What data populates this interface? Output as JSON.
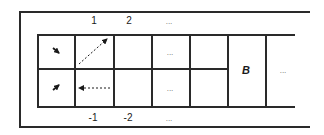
{
  "diagram": {
    "top_labels": [
      "1",
      "2",
      "..."
    ],
    "bottom_labels": [
      "-1",
      "-2",
      "..."
    ],
    "cell_dots_top": "...",
    "cell_dots_bottom": "...",
    "b_cell_label": "B",
    "right_dots": "...",
    "arrows": [
      {
        "cell": "top-left",
        "direction": "down-right",
        "style": "solid-short"
      },
      {
        "cell": "bottom-left",
        "direction": "up-right",
        "style": "solid-short"
      },
      {
        "cell": "top-col1",
        "direction": "up-right",
        "style": "dashed"
      },
      {
        "cell": "bottom-col1",
        "direction": "left",
        "style": "dashed"
      }
    ]
  }
}
